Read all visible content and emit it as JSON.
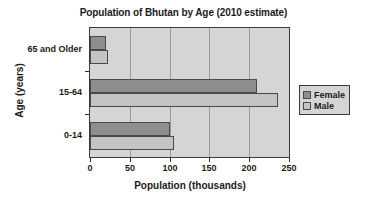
{
  "chart_data": {
    "type": "bar",
    "orientation": "horizontal",
    "title": "Population of Bhutan by Age (2010 estimate)",
    "xlabel": "Population (thousands)",
    "ylabel": "Age (years)",
    "categories": [
      "0-14",
      "15-64",
      "65 and Older"
    ],
    "series": [
      {
        "name": "Female",
        "color": "#8e8e8e",
        "values": [
          101,
          210,
          20
        ]
      },
      {
        "name": "Male",
        "color": "#c4c4c4",
        "values": [
          105,
          236,
          22
        ]
      }
    ],
    "xticks": [
      0,
      50,
      100,
      150,
      200,
      250
    ],
    "xticklabels": [
      "0",
      "50",
      "100",
      "150",
      "200",
      "250"
    ],
    "xlim": [
      0,
      250
    ],
    "grid": true,
    "grid_axis": "x",
    "legend_position": "right",
    "plot_background": "#d5d5d5",
    "page_background": "#ffffff"
  }
}
